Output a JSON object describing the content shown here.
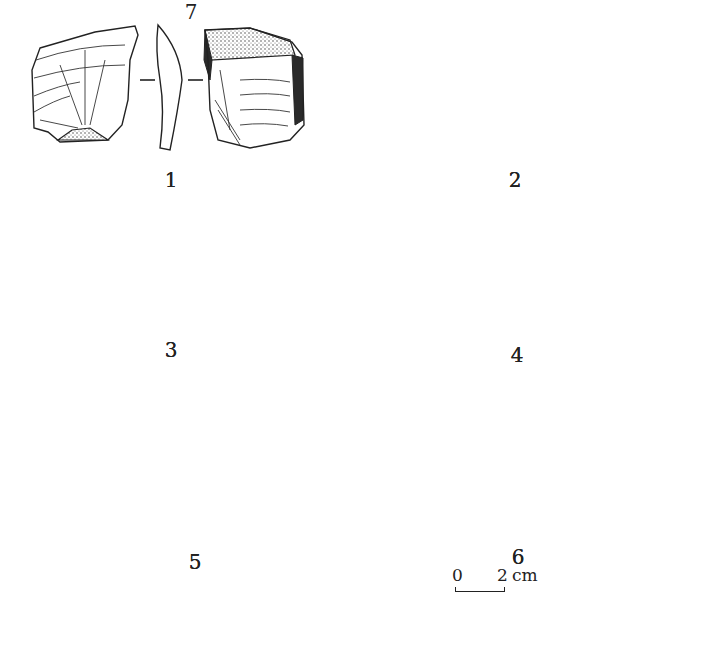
{
  "figure": {
    "type": "archaeological lithic artifact line drawing",
    "artifacts": [
      {
        "number": "1",
        "views": [
          "dorsal",
          "profile",
          "ventral"
        ]
      },
      {
        "number": "2",
        "views": [
          "dorsal",
          "profile",
          "ventral"
        ]
      },
      {
        "number": "3",
        "views": [
          "dorsal",
          "profile",
          "ventral"
        ]
      },
      {
        "number": "4",
        "views": [
          "dorsal",
          "profile",
          "ventral"
        ]
      },
      {
        "number": "5",
        "views": [
          "dorsal",
          "profile",
          "ventral"
        ]
      },
      {
        "number": "6",
        "views": [
          "dorsal",
          "profile",
          "ventral"
        ]
      },
      {
        "number": "7",
        "views": [
          "dorsal",
          "profile",
          "ventral"
        ]
      }
    ],
    "scale_bar": {
      "start": "0",
      "end": "2",
      "unit": "cm"
    }
  }
}
